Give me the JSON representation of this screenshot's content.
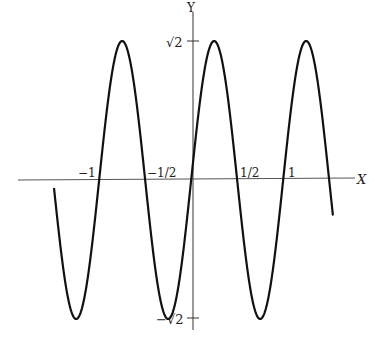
{
  "chart_data": {
    "type": "line",
    "title": "",
    "function": "y = sqrt(2) * sin(2*pi*x)",
    "xlabel": "X",
    "ylabel": "Y",
    "xlim": [
      -1.52,
      1.52
    ],
    "ylim": [
      -1.4142,
      1.4142
    ],
    "grid": false,
    "legend": null,
    "x_ticks": [
      {
        "value": -1,
        "label": "−1"
      },
      {
        "value": -0.5,
        "label": "−1/2"
      },
      {
        "value": 0.5,
        "label": "1/2"
      },
      {
        "value": 1,
        "label": "1"
      }
    ],
    "y_ticks": [
      {
        "value": 1.4142,
        "label": "√2"
      },
      {
        "value": -1.4142,
        "label": "−√2"
      }
    ],
    "series": [
      {
        "name": "y = √2 sin(2πx)",
        "x": [
          -1.51,
          -1.25,
          -1.0,
          -0.75,
          -0.5,
          -0.25,
          0.0,
          0.25,
          0.5,
          0.75,
          1.0,
          1.25,
          1.52
        ],
        "y": [
          0.18,
          -1.4142,
          0.0,
          1.4142,
          0.0,
          -1.4142,
          0.0,
          1.4142,
          0.0,
          -1.4142,
          0.0,
          1.4142,
          -0.18
        ],
        "color": "#111111"
      }
    ]
  },
  "axes": {
    "x_label": "X",
    "y_label": "Y",
    "sqrt2_label": "√2",
    "neg_sqrt2_label": "−√2"
  },
  "layout": {
    "origin_px": [
      193,
      180
    ],
    "unit_x_px": 92,
    "unit_y_px": 98.3
  }
}
